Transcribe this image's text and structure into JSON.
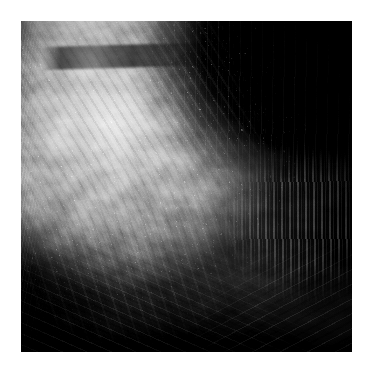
{
  "document": {
    "kind": "photograph",
    "title": "Grayscale Texture Photograph",
    "medium": "monochrome photographic plate",
    "subject": "abstract organic rock or shell-like textured mass",
    "palette": {
      "page_background": "#ffffff",
      "plate_background": "#070707",
      "shadow_black": "#020202",
      "deep_shadow": "#0c0c0c",
      "midtone_gray": "#5a5a5a",
      "light_gray": "#949494",
      "highlight_gray": "#c2c2c2",
      "brightest_highlight": "#cfcfcf"
    },
    "geometry": {
      "canvas_width": 370,
      "canvas_height": 372,
      "margin_left": 21,
      "margin_top": 21,
      "plate_width": 331,
      "plate_height": 331
    }
  },
  "regions": [
    {
      "id": "bright-dome",
      "label": "Bright striated dome",
      "description": "Large illuminated mass with diagonal striations occupying the upper-left and center",
      "tone": "#c2c2c2"
    },
    {
      "id": "dark-void",
      "label": "Dark vertical-streaked void",
      "description": "Near-black field with fine vertical streaks filling the upper-right quadrant",
      "tone": "#010101"
    },
    {
      "id": "right-pillar",
      "label": "Bright pillar formation",
      "description": "Vertical ridge of bright highlights along the middle-right edge",
      "tone": "#cdcdcd"
    },
    {
      "id": "lower-shadow",
      "label": "Lower diagonal shadow band",
      "description": "Dark diagonal band sweeping across the bottom-left and base of the frame",
      "tone": "#060606"
    },
    {
      "id": "left-granular-edge",
      "label": "Granular left edge",
      "description": "Narrow dark granular strip running down the left border of the plate",
      "tone": "#1a1a1a"
    },
    {
      "id": "top-crest",
      "label": "Top crest and crack line",
      "description": "Thin bright rim along the top-left crossed by a dark fissure",
      "tone": "#bebebe"
    }
  ]
}
